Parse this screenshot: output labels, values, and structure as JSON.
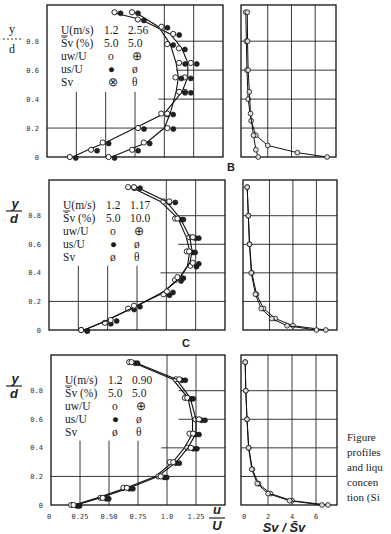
{
  "figure": {
    "panel_labels": [
      "B",
      "C"
    ],
    "y_axis_label": {
      "top": "y",
      "bottom": "d"
    },
    "x_axis_label_left": {
      "top": "u",
      "bottom": "U"
    },
    "x_axis_label_right": "Sv / S̄v",
    "y_ticks": [
      "0.8",
      "0.6",
      "0.4",
      "0.2",
      "0"
    ],
    "x_ticks_left": [
      "0",
      "0.25",
      "0.50",
      "0.75",
      "1.0",
      "1.25"
    ],
    "x_ticks_right": [
      "0",
      "2",
      "4",
      "6"
    ],
    "caption_lines": [
      "Figure",
      "profiles",
      "and liqu",
      "concen",
      "tion (Si"
    ]
  },
  "panels": [
    {
      "id": "top",
      "legend": {
        "header": [
          "U(m/s)",
          "1.2",
          "2.56"
        ],
        "sv_row": [
          "S̄v (%)",
          "5.0",
          "5.0"
        ],
        "rows": [
          {
            "label": "uw/U",
            "sym1": "o",
            "sym2": "⊕"
          },
          {
            "label": "us/U",
            "sym1": "●",
            "sym2": "ø"
          },
          {
            "label": "Sv",
            "sym1": "⊗",
            "sym2": "θ"
          }
        ]
      }
    },
    {
      "id": "B",
      "legend": {
        "header": [
          "U(m/s)",
          "1.2",
          "1.17"
        ],
        "sv_row": [
          "S̄v (%)",
          "5.0",
          "10.0"
        ],
        "rows": [
          {
            "label": "uw/U",
            "sym1": "o",
            "sym2": "⊕"
          },
          {
            "label": "us/U",
            "sym1": "●",
            "sym2": "ø"
          },
          {
            "label": "Sv",
            "sym1": "ø",
            "sym2": "θ"
          }
        ]
      }
    },
    {
      "id": "C",
      "legend": {
        "header": [
          "U(m/s)",
          "1.2",
          "0.90"
        ],
        "sv_row": [
          "S̄v (%)",
          "5.0",
          "5.0"
        ],
        "rows": [
          {
            "label": "uw/U",
            "sym1": "o",
            "sym2": "⊕"
          },
          {
            "label": "us/U",
            "sym1": "●",
            "sym2": "ø"
          },
          {
            "label": "Sv",
            "sym1": "ø",
            "sym2": "θ"
          }
        ]
      }
    }
  ],
  "chart_data": [
    {
      "type": "line",
      "title": "Velocity profiles (panel 1)",
      "xlabel": "u/U",
      "ylabel": "y/d",
      "xlim": [
        0,
        1.5
      ],
      "ylim": [
        0,
        1.0
      ],
      "series": [
        {
          "name": "U=1.2 m/s, Sv=5.0% (uw/U, us/U)",
          "x": [
            0.22,
            0.35,
            0.5,
            0.75,
            1.0,
            1.15,
            1.2,
            1.2,
            1.15,
            1.05,
            0.8,
            0.55
          ],
          "y": [
            0.0,
            0.05,
            0.1,
            0.2,
            0.3,
            0.45,
            0.55,
            0.65,
            0.75,
            0.85,
            0.95,
            1.0
          ]
        },
        {
          "name": "U=2.56 m/s, Sv=5.0% (uw/U, us/U)",
          "x": [
            0.55,
            0.7,
            0.85,
            1.0,
            1.05,
            1.1,
            1.12,
            1.1,
            1.05,
            0.95,
            0.75
          ],
          "y": [
            0.0,
            0.05,
            0.1,
            0.2,
            0.3,
            0.45,
            0.55,
            0.65,
            0.78,
            0.9,
            1.0
          ]
        }
      ]
    },
    {
      "type": "line",
      "title": "Concentration profiles (panel 1)",
      "xlabel": "Sv/S̄v",
      "ylabel": "y/d",
      "xlim": [
        0,
        7.5
      ],
      "ylim": [
        0,
        1.0
      ],
      "series": [
        {
          "name": "U=1.2 m/s",
          "x": [
            7.0,
            4.5,
            2.0,
            1.0,
            0.6,
            0.35,
            0.25,
            0.2,
            0.15
          ],
          "y": [
            0.0,
            0.03,
            0.08,
            0.15,
            0.25,
            0.4,
            0.6,
            0.8,
            1.0
          ]
        },
        {
          "name": "U=2.56 m/s",
          "x": [
            1.2,
            1.0,
            0.8,
            0.55,
            0.45,
            0.35,
            0.3,
            0.28
          ],
          "y": [
            0.0,
            0.05,
            0.15,
            0.3,
            0.45,
            0.6,
            0.8,
            1.0
          ]
        }
      ]
    },
    {
      "type": "line",
      "title": "Velocity profiles (panel B)",
      "xlabel": "u/U",
      "ylabel": "y/d",
      "xlim": [
        0,
        1.5
      ],
      "ylim": [
        0,
        1.0
      ],
      "series": [
        {
          "name": "U=1.2 m/s, Sv=5.0%",
          "x": [
            0.3,
            0.45,
            0.7,
            0.95,
            1.1,
            1.18,
            1.2,
            1.17,
            1.1,
            0.95,
            0.7
          ],
          "y": [
            0.0,
            0.05,
            0.15,
            0.25,
            0.35,
            0.45,
            0.55,
            0.65,
            0.78,
            0.9,
            1.0
          ]
        },
        {
          "name": "U=1.17 m/s, Sv=10.0%",
          "x": [
            0.3,
            0.5,
            0.75,
            0.98,
            1.12,
            1.2,
            1.22,
            1.2,
            1.12,
            1.0,
            0.75
          ],
          "y": [
            0.0,
            0.07,
            0.17,
            0.27,
            0.37,
            0.47,
            0.55,
            0.65,
            0.78,
            0.9,
            1.0
          ]
        }
      ]
    },
    {
      "type": "line",
      "title": "Concentration profiles (panel B)",
      "xlabel": "Sv/S̄v",
      "ylabel": "y/d",
      "xlim": [
        0,
        7.5
      ],
      "ylim": [
        0,
        1.0
      ],
      "series": [
        {
          "name": "U=1.2 m/s",
          "x": [
            6.8,
            4.0,
            2.5,
            1.5,
            0.9,
            0.5,
            0.3,
            0.2,
            0.1
          ],
          "y": [
            0.0,
            0.03,
            0.08,
            0.15,
            0.25,
            0.4,
            0.6,
            0.8,
            1.0
          ]
        },
        {
          "name": "U=1.17 m/s",
          "x": [
            6.0,
            3.5,
            2.2,
            1.3,
            0.8,
            0.45,
            0.3,
            0.2,
            0.1
          ],
          "y": [
            0.0,
            0.03,
            0.08,
            0.15,
            0.25,
            0.4,
            0.6,
            0.8,
            1.0
          ]
        }
      ]
    },
    {
      "type": "line",
      "title": "Velocity profiles (panel C)",
      "xlabel": "u/U",
      "ylabel": "y/d",
      "xlim": [
        0,
        1.5
      ],
      "ylim": [
        0,
        1.0
      ],
      "series": [
        {
          "name": "U=1.2 m/s, Sv=5.0%",
          "x": [
            0.2,
            0.4,
            0.65,
            0.9,
            1.05,
            1.15,
            1.22,
            1.22,
            1.18,
            1.05,
            0.7
          ],
          "y": [
            0.0,
            0.05,
            0.12,
            0.2,
            0.3,
            0.4,
            0.5,
            0.6,
            0.75,
            0.88,
            1.0
          ]
        },
        {
          "name": "U=0.90 m/s, Sv=5.0%",
          "x": [
            0.22,
            0.42,
            0.68,
            0.92,
            1.08,
            1.18,
            1.25,
            1.25,
            1.2,
            1.08,
            0.72
          ],
          "y": [
            0.0,
            0.05,
            0.12,
            0.2,
            0.3,
            0.4,
            0.5,
            0.6,
            0.75,
            0.88,
            1.0
          ]
        }
      ]
    },
    {
      "type": "line",
      "title": "Concentration profiles (panel C)",
      "xlabel": "Sv/S̄v",
      "ylabel": "y/d",
      "xlim": [
        0,
        7.5
      ],
      "ylim": [
        0,
        1.0
      ],
      "series": [
        {
          "name": "U=1.2 m/s",
          "x": [
            7.0,
            4.0,
            2.2,
            1.2,
            0.7,
            0.4,
            0.25,
            0.15,
            0.1
          ],
          "y": [
            0.0,
            0.03,
            0.08,
            0.15,
            0.25,
            0.4,
            0.6,
            0.8,
            1.0
          ]
        },
        {
          "name": "U=0.90 m/s",
          "x": [
            6.5,
            3.8,
            2.0,
            1.1,
            0.65,
            0.38,
            0.25,
            0.15,
            0.1
          ],
          "y": [
            0.0,
            0.03,
            0.08,
            0.15,
            0.25,
            0.4,
            0.6,
            0.8,
            1.0
          ]
        }
      ]
    }
  ]
}
